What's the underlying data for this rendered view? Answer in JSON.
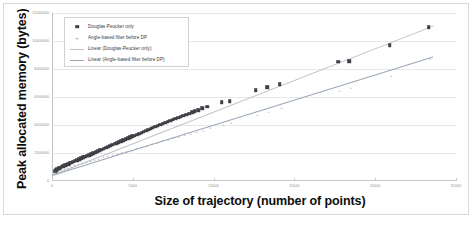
{
  "chart_data": {
    "type": "scatter",
    "title": "",
    "xlabel": "Size of trajectory (number of points)",
    "ylabel": "Peak allocated memory (bytes)",
    "xlim": [
      0,
      25000
    ],
    "ylim": [
      0,
      12000000
    ],
    "grid": true,
    "legend_position": "top-left",
    "x_ticks": [
      0,
      5000,
      10000,
      15000,
      20000,
      25000
    ],
    "x_tick_labels": [
      "0",
      "5000",
      "10000",
      "15000",
      "20000",
      "25000"
    ],
    "y_ticks": [
      0,
      2000000,
      4000000,
      6000000,
      8000000,
      10000000,
      12000000
    ],
    "y_tick_labels": [
      "0",
      "2000000",
      "4000000",
      "6000000",
      "8000000",
      "10000000",
      "12000000"
    ],
    "series": [
      {
        "name": "Douglas-Peucker only",
        "marker": "square",
        "color": "#3f3f46",
        "points": [
          [
            180,
            700000
          ],
          [
            260,
            780000
          ],
          [
            340,
            840000
          ],
          [
            430,
            900000
          ],
          [
            520,
            960000
          ],
          [
            610,
            1010000
          ],
          [
            700,
            1060000
          ],
          [
            800,
            1110000
          ],
          [
            900,
            1160000
          ],
          [
            1000,
            1210000
          ],
          [
            1100,
            1260000
          ],
          [
            1200,
            1320000
          ],
          [
            1320,
            1380000
          ],
          [
            1450,
            1450000
          ],
          [
            1560,
            1500000
          ],
          [
            1680,
            1560000
          ],
          [
            1800,
            1620000
          ],
          [
            1920,
            1680000
          ],
          [
            2050,
            1740000
          ],
          [
            2180,
            1800000
          ],
          [
            2300,
            1860000
          ],
          [
            2420,
            1920000
          ],
          [
            2560,
            1990000
          ],
          [
            2700,
            2060000
          ],
          [
            2820,
            2120000
          ],
          [
            2950,
            2190000
          ],
          [
            3080,
            2250000
          ],
          [
            3200,
            2310000
          ],
          [
            3340,
            2380000
          ],
          [
            3480,
            2450000
          ],
          [
            3600,
            2510000
          ],
          [
            3740,
            2580000
          ],
          [
            3880,
            2650000
          ],
          [
            4000,
            2710000
          ],
          [
            4140,
            2780000
          ],
          [
            4280,
            2850000
          ],
          [
            4400,
            2910000
          ],
          [
            4550,
            2980000
          ],
          [
            4700,
            3050000
          ],
          [
            4840,
            3120000
          ],
          [
            4980,
            3180000
          ],
          [
            5120,
            3250000
          ],
          [
            5260,
            3320000
          ],
          [
            5400,
            3390000
          ],
          [
            5540,
            3450000
          ],
          [
            5680,
            3520000
          ],
          [
            5820,
            3590000
          ],
          [
            5960,
            3660000
          ],
          [
            6100,
            3730000
          ],
          [
            6240,
            3800000
          ],
          [
            6400,
            3870000
          ],
          [
            6550,
            3940000
          ],
          [
            6700,
            4010000
          ],
          [
            6860,
            4080000
          ],
          [
            7000,
            4150000
          ],
          [
            7160,
            4230000
          ],
          [
            7320,
            4300000
          ],
          [
            7480,
            4370000
          ],
          [
            7640,
            4440000
          ],
          [
            7800,
            4510000
          ],
          [
            7960,
            4580000
          ],
          [
            8120,
            4660000
          ],
          [
            8300,
            4740000
          ],
          [
            8480,
            4820000
          ],
          [
            8660,
            4900000
          ],
          [
            8840,
            4980000
          ],
          [
            9050,
            5060000
          ],
          [
            9300,
            5180000
          ],
          [
            9600,
            5300000
          ],
          [
            10500,
            5620000
          ],
          [
            11000,
            5720000
          ],
          [
            12600,
            6480000
          ],
          [
            13300,
            6700000
          ],
          [
            14100,
            6920000
          ],
          [
            17700,
            8520000
          ],
          [
            18400,
            8560000
          ],
          [
            20900,
            9700000
          ],
          [
            23300,
            11000000
          ]
        ]
      },
      {
        "name": "Angle-based filter before DP",
        "marker": "plus",
        "color": "#9a9aa4",
        "points": [
          [
            200,
            640000
          ],
          [
            380,
            720000
          ],
          [
            560,
            800000
          ],
          [
            760,
            880000
          ],
          [
            960,
            950000
          ],
          [
            1180,
            1030000
          ],
          [
            1400,
            1110000
          ],
          [
            1640,
            1190000
          ],
          [
            1880,
            1270000
          ],
          [
            2120,
            1350000
          ],
          [
            2380,
            1430000
          ],
          [
            2640,
            1520000
          ],
          [
            2900,
            1600000
          ],
          [
            3180,
            1690000
          ],
          [
            3460,
            1780000
          ],
          [
            3740,
            1870000
          ],
          [
            4020,
            1960000
          ],
          [
            4320,
            2050000
          ],
          [
            4620,
            2140000
          ],
          [
            4920,
            2240000
          ],
          [
            5220,
            2330000
          ],
          [
            5540,
            2430000
          ],
          [
            5860,
            2530000
          ],
          [
            6180,
            2630000
          ],
          [
            6500,
            2730000
          ],
          [
            6840,
            2830000
          ],
          [
            7180,
            2940000
          ],
          [
            7520,
            3040000
          ],
          [
            7860,
            3150000
          ],
          [
            8220,
            3260000
          ],
          [
            8580,
            3370000
          ],
          [
            8940,
            3480000
          ],
          [
            9360,
            3600000
          ],
          [
            9800,
            3760000
          ],
          [
            10600,
            4030000
          ],
          [
            11100,
            4160000
          ],
          [
            12700,
            4700000
          ],
          [
            13400,
            4950000
          ],
          [
            14200,
            5180000
          ],
          [
            17800,
            6460000
          ],
          [
            18500,
            6640000
          ],
          [
            21000,
            7520000
          ],
          [
            23400,
            8720000
          ]
        ]
      }
    ],
    "trendlines": [
      {
        "name": "Linear (Douglas-Peucker only)",
        "color": "#bfbfc6",
        "x0": 0,
        "y0": 420000,
        "x1": 23600,
        "y1": 11100000
      },
      {
        "name": "Linear (Angle-based filter before DP)",
        "color": "#9aa6b8",
        "x0": 0,
        "y0": 430000,
        "x1": 23600,
        "y1": 8900000
      }
    ],
    "legend_entries": [
      {
        "label": "Douglas-Peucker only",
        "symbol": "square-marker",
        "color": "#3f3f46"
      },
      {
        "label": "Angle-based filter before DP",
        "symbol": "plus-marker",
        "color": "#9a9aa4"
      },
      {
        "label": "Linear (Douglas-Peucker only)",
        "symbol": "line-swatch",
        "color": "#bfbfc6"
      },
      {
        "label": "Linear (Angle-based filter before DP)",
        "symbol": "line-swatch",
        "color": "#9aa6b8"
      }
    ]
  }
}
